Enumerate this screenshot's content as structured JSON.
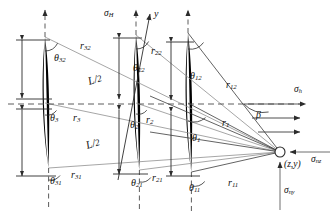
{
  "figure": {
    "kind": "mechanics-diagram",
    "width": 332,
    "height": 222,
    "colors": {
      "crack_fill": "#000000",
      "ray": "#8c8c8c",
      "axis": "#3a3a3a",
      "dashed": "#6b6b6b",
      "text": "#111111"
    }
  },
  "stress_labels": {
    "sigma_H": {
      "base": "σ",
      "sub": "H"
    },
    "sigma_h": {
      "base": "σ",
      "sub": "h"
    },
    "sigma_nz": {
      "base": "σ",
      "sub": "nz"
    },
    "sigma_ny": {
      "base": "σ",
      "sub": "ny"
    }
  },
  "axes": {
    "y_axis": "y",
    "beta": "β"
  },
  "point": {
    "coords": "(z,y)"
  },
  "lengths": {
    "half_upper": {
      "num": "L",
      "den": "2"
    },
    "half_lower": {
      "num": "L",
      "den": "2"
    }
  },
  "angles": [
    {
      "id": "theta32",
      "base": "θ",
      "sub": "32",
      "x": 54,
      "y": 53
    },
    {
      "id": "theta3",
      "base": "θ",
      "sub": "3",
      "x": 50,
      "y": 113
    },
    {
      "id": "theta31",
      "base": "θ",
      "sub": "31",
      "x": 50,
      "y": 176
    },
    {
      "id": "theta22",
      "base": "θ",
      "sub": "22",
      "x": 133,
      "y": 63
    },
    {
      "id": "theta2",
      "base": "θ",
      "sub": "2",
      "x": 130,
      "y": 120
    },
    {
      "id": "theta21",
      "base": "θ",
      "sub": "21",
      "x": 131,
      "y": 178
    },
    {
      "id": "theta12",
      "base": "θ",
      "sub": "12",
      "x": 190,
      "y": 71
    },
    {
      "id": "theta1",
      "base": "θ",
      "sub": "1",
      "x": 192,
      "y": 133
    },
    {
      "id": "theta11",
      "base": "θ",
      "sub": "11",
      "x": 189,
      "y": 183
    }
  ],
  "radii": [
    {
      "id": "r32",
      "base": "r",
      "sub": "32",
      "x": 80,
      "y": 41
    },
    {
      "id": "r3",
      "base": "r",
      "sub": "3",
      "x": 73,
      "y": 113
    },
    {
      "id": "r31",
      "base": "r",
      "sub": "31",
      "x": 71,
      "y": 170
    },
    {
      "id": "r22",
      "base": "r",
      "sub": "22",
      "x": 151,
      "y": 46
    },
    {
      "id": "r2",
      "base": "r",
      "sub": "2",
      "x": 146,
      "y": 115
    },
    {
      "id": "r21",
      "base": "r",
      "sub": "21",
      "x": 152,
      "y": 173
    },
    {
      "id": "r12",
      "base": "r",
      "sub": "12",
      "x": 226,
      "y": 80
    },
    {
      "id": "r1",
      "base": "r",
      "sub": "1",
      "x": 222,
      "y": 118
    },
    {
      "id": "r11",
      "base": "r",
      "sub": "11",
      "x": 228,
      "y": 178
    }
  ]
}
